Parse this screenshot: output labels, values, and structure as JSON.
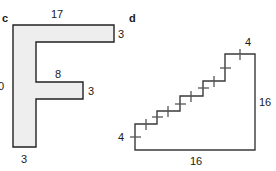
{
  "figures": [
    {
      "id": "c",
      "letter": "c",
      "shape_name": "F-shape polygon",
      "labels": [
        {
          "name": "top-width",
          "text": "17"
        },
        {
          "name": "top-bar-thickness",
          "text": "3"
        },
        {
          "name": "left-height",
          "text": "0"
        },
        {
          "name": "middle-bar-width",
          "text": "8"
        },
        {
          "name": "middle-bar-thickness",
          "text": "3"
        },
        {
          "name": "stem-width",
          "text": "3"
        }
      ]
    },
    {
      "id": "d",
      "letter": "d",
      "shape_name": "staircase polygon",
      "labels": [
        {
          "name": "top-step-width",
          "text": "4"
        },
        {
          "name": "right-height",
          "text": "16"
        },
        {
          "name": "bottom-width",
          "text": "16"
        },
        {
          "name": "bottom-left-rise",
          "text": "4"
        }
      ]
    }
  ],
  "colors": {
    "shape_fill": "#eeeeee",
    "stroke": "#222222",
    "tick": "#555555",
    "text": "#1a1a1a",
    "background": "#ffffff"
  }
}
